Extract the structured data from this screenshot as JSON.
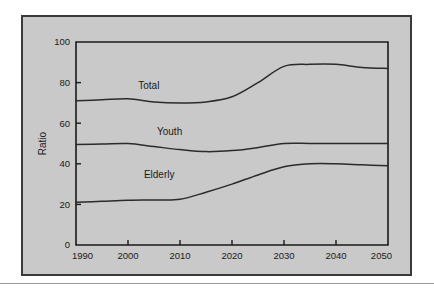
{
  "chart_data": {
    "type": "line",
    "title": "",
    "xlabel": "",
    "ylabel": "Ratio",
    "xlim": [
      1990,
      2050
    ],
    "ylim": [
      0,
      100
    ],
    "grid": false,
    "legend_position": "inline-labels",
    "xticks": [
      "1990",
      "2000",
      "2010",
      "2020",
      "2030",
      "2040",
      "2050"
    ],
    "yticks": [
      "0",
      "20",
      "40",
      "60",
      "80",
      "100"
    ],
    "x": [
      1990,
      1995,
      2000,
      2005,
      2010,
      2015,
      2020,
      2025,
      2030,
      2035,
      2040,
      2045,
      2050
    ],
    "series": [
      {
        "name": "Total",
        "label": "Total",
        "values": [
          71,
          71.5,
          72,
          70.5,
          70,
          70.5,
          73,
          80,
          88,
          89,
          89,
          87.5,
          87
        ]
      },
      {
        "name": "Youth",
        "label": "Youth",
        "values": [
          49.5,
          49.7,
          50,
          48.5,
          47,
          46,
          46.5,
          48,
          50,
          50,
          50,
          50,
          50
        ]
      },
      {
        "name": "Elderly",
        "label": "Elderly",
        "values": [
          21,
          21.5,
          22,
          22.2,
          22.5,
          26,
          30,
          34.5,
          38.5,
          40,
          40,
          39.5,
          39
        ]
      }
    ],
    "inline_labels": [
      {
        "text": "Total",
        "x": 2004,
        "y": 77
      },
      {
        "text": "Youth",
        "x": 2008,
        "y": 54
      },
      {
        "text": "Elderly",
        "x": 2006,
        "y": 33
      }
    ],
    "colors": {
      "line": "#2b2b2b",
      "axis": "#1a1a1a",
      "panel_background": "#c9c9c9",
      "panel_border": "#3a3a3a",
      "page_background": "#ffffff"
    }
  }
}
